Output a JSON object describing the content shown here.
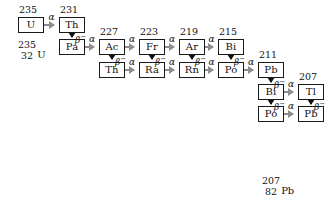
{
  "figure": {
    "colors": {
      "alpha_arrow": "#8c8c8c",
      "beta_arrow": "#111111",
      "box_border": "#1a1a1a",
      "background": "#ffffff",
      "text": "#111111"
    }
  },
  "labels": {
    "alpha": "α",
    "beta": "β",
    "beta_charge": "−"
  },
  "start_notation": {
    "mass_number": "235",
    "atomic_number": "32",
    "symbol": "U"
  },
  "end_notation": {
    "mass_number": "207",
    "atomic_number": "82",
    "symbol": "Pb"
  },
  "nuclides": [
    {
      "id": "u235",
      "symbol": "U",
      "mass": "235",
      "show_mass": true,
      "x": 26,
      "y": 24
    },
    {
      "id": "th231",
      "symbol": "Th",
      "mass": "231",
      "show_mass": true,
      "x": 84,
      "y": 24
    },
    {
      "id": "pa231",
      "symbol": "Pa",
      "mass": "",
      "show_mass": false,
      "x": 84,
      "y": 56
    },
    {
      "id": "ac227",
      "symbol": "Ac",
      "mass": "227",
      "show_mass": true,
      "x": 141,
      "y": 56
    },
    {
      "id": "th227",
      "symbol": "Th",
      "mass": "",
      "show_mass": false,
      "x": 141,
      "y": 88
    },
    {
      "id": "fr223",
      "symbol": "Fr",
      "mass": "223",
      "show_mass": true,
      "x": 198,
      "y": 56
    },
    {
      "id": "ra223",
      "symbol": "Ra",
      "mass": "",
      "show_mass": false,
      "x": 198,
      "y": 88
    },
    {
      "id": "at219",
      "symbol": "Ar",
      "mass": "219",
      "show_mass": true,
      "x": 255,
      "y": 56
    },
    {
      "id": "rn219",
      "symbol": "Rn",
      "mass": "",
      "show_mass": false,
      "x": 255,
      "y": 88
    },
    {
      "id": "bi215",
      "symbol": "Bi",
      "mass": "215",
      "show_mass": true,
      "x": 312,
      "y": 56
    },
    {
      "id": "po215",
      "symbol": "Po",
      "mass": "",
      "show_mass": false,
      "x": 312,
      "y": 88
    },
    {
      "id": "pb211",
      "symbol": "Pb",
      "mass": "211",
      "show_mass": true,
      "x": 369,
      "y": 88
    },
    {
      "id": "bi211",
      "symbol": "Bi",
      "mass": "",
      "show_mass": false,
      "x": 369,
      "y": 120
    },
    {
      "id": "tl207",
      "symbol": "Tl",
      "mass": "207",
      "show_mass": true,
      "x": 426,
      "y": 120
    },
    {
      "id": "po211",
      "symbol": "Po",
      "mass": "",
      "show_mass": false,
      "x": 369,
      "y": 152
    },
    {
      "id": "pb207",
      "symbol": "Pb",
      "mass": "",
      "show_mass": false,
      "x": 426,
      "y": 152
    }
  ],
  "decays": [
    {
      "from": "u235",
      "to": "th231",
      "mode": "alpha"
    },
    {
      "from": "th231",
      "to": "pa231",
      "mode": "beta"
    },
    {
      "from": "pa231",
      "to": "ac227",
      "mode": "alpha"
    },
    {
      "from": "ac227",
      "to": "th227",
      "mode": "beta"
    },
    {
      "from": "ac227",
      "to": "fr223",
      "mode": "alpha"
    },
    {
      "from": "th227",
      "to": "ra223",
      "mode": "alpha"
    },
    {
      "from": "fr223",
      "to": "ra223",
      "mode": "beta"
    },
    {
      "from": "fr223",
      "to": "at219",
      "mode": "alpha"
    },
    {
      "from": "ra223",
      "to": "rn219",
      "mode": "alpha"
    },
    {
      "from": "at219",
      "to": "rn219",
      "mode": "beta"
    },
    {
      "from": "at219",
      "to": "bi215",
      "mode": "alpha"
    },
    {
      "from": "rn219",
      "to": "po215",
      "mode": "alpha"
    },
    {
      "from": "bi215",
      "to": "po215",
      "mode": "beta"
    },
    {
      "from": "po215",
      "to": "pb211",
      "mode": "alpha"
    },
    {
      "from": "pb211",
      "to": "bi211",
      "mode": "beta"
    },
    {
      "from": "bi211",
      "to": "tl207",
      "mode": "alpha"
    },
    {
      "from": "bi211",
      "to": "po211",
      "mode": "beta"
    },
    {
      "from": "tl207",
      "to": "pb207",
      "mode": "beta"
    },
    {
      "from": "po211",
      "to": "pb207",
      "mode": "alpha"
    }
  ]
}
